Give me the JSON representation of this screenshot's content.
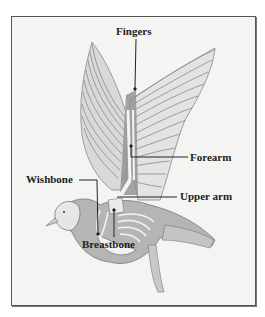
{
  "diagram": {
    "labels": {
      "fingers": "Fingers",
      "forearm": "Forearm",
      "wishbone": "Wishbone",
      "upper_arm": "Upper arm",
      "breastbone": "Breastbone"
    },
    "colors": {
      "background": "#f4f4f3",
      "frame": "#555555",
      "text": "#222222",
      "feather": "#8a8a8a",
      "body_shade": "#9a9a9a",
      "bone": "#f2f2f2"
    }
  }
}
